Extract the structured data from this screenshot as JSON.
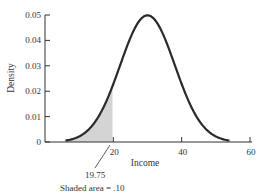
{
  "chart_data": {
    "type": "area",
    "title": "",
    "xlabel": "Income",
    "ylabel": "Density",
    "xlim": [
      0,
      60
    ],
    "ylim": [
      0,
      0.05
    ],
    "x_ticks": [
      20,
      40,
      60
    ],
    "x_tick_labels": [
      "20",
      "40",
      "60"
    ],
    "y_ticks": [
      0,
      0.01,
      0.02,
      0.03,
      0.04,
      0.05
    ],
    "y_tick_labels": [
      "0",
      "0.01",
      "0.02",
      "0.03",
      "0.04",
      "0.05"
    ],
    "distribution": {
      "name": "normal",
      "mean": 30,
      "sd": 8
    },
    "series": [
      {
        "name": "density",
        "x": [
          6,
          10,
          14,
          18,
          19.75,
          22,
          26,
          30,
          34,
          38,
          42,
          46,
          50,
          54
        ],
        "values": [
          0.0006,
          0.0022,
          0.0068,
          0.0162,
          0.022,
          0.0302,
          0.0441,
          0.0499,
          0.0441,
          0.0302,
          0.0162,
          0.0068,
          0.0022,
          0.0006
        ]
      }
    ],
    "shaded_region": {
      "from": 6,
      "to": 19.75,
      "area": 0.1,
      "color": "#d4d4d4"
    },
    "annotations": [
      {
        "text": "19.75",
        "points_to_x": 19.75
      },
      {
        "text": "Shaded area = .10"
      }
    ],
    "grid": false,
    "legend": null
  },
  "labels": {
    "xlabel": "Income",
    "ylabel": "Density",
    "cutoff": "19.75",
    "shaded_note": "Shaded area = .10",
    "y_ticks": [
      "0",
      "0.01",
      "0.02",
      "0.03",
      "0.04",
      "0.05"
    ],
    "x_ticks": [
      "20",
      "40",
      "60"
    ]
  },
  "colors": {
    "curve": "#2a2a2a",
    "shade": "#d4d4d4",
    "axis": "#333333"
  }
}
